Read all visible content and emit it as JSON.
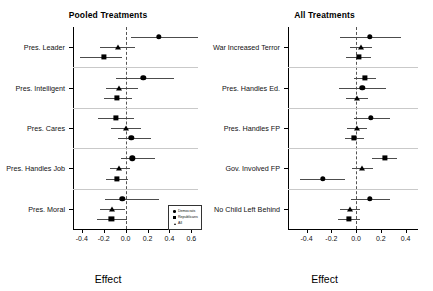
{
  "figure": {
    "width": 433,
    "height": 291,
    "background": "#ffffff",
    "marker_color": "#000000",
    "ci_color": "#4c4c4c",
    "separator_color": "#c9c9c9",
    "zero_line_color": "#555555"
  },
  "legend": {
    "entries": [
      {
        "label": "Democrats",
        "marker": "circle"
      },
      {
        "label": "Republicans",
        "marker": "square"
      },
      {
        "label": "All",
        "marker": "triangle"
      }
    ]
  },
  "chart_data": [
    {
      "type": "scatter",
      "panel": "left",
      "title": "Pooled Treatments",
      "xlabel": "Effect",
      "ylabel": "",
      "xlim": [
        -0.48,
        0.66
      ],
      "xticks": [
        -0.4,
        -0.2,
        0.0,
        0.2,
        0.4,
        0.6
      ],
      "xticklabels": [
        "-0.4",
        "-0.2",
        "0.0",
        "0.2",
        "0.4",
        "0.6"
      ],
      "grid": false,
      "zero_reference": 0.0,
      "categories": [
        "Pres. Leader",
        "Pres. Intelligent",
        "Pres. Cares",
        "Pres. Handles Job",
        "Pres. Moral"
      ],
      "series": [
        {
          "name": "Democrats",
          "marker": "circle",
          "values": [
            0.3,
            0.16,
            0.05,
            0.06,
            -0.03
          ],
          "ci_low": [
            0.05,
            -0.09,
            -0.07,
            -0.04,
            -0.19
          ],
          "ci_high": [
            0.66,
            0.44,
            0.23,
            0.27,
            0.3
          ]
        },
        {
          "name": "Republicans",
          "marker": "square",
          "values": [
            -0.2,
            -0.08,
            -0.09,
            -0.08,
            -0.13
          ],
          "ci_low": [
            -0.42,
            -0.2,
            -0.25,
            -0.18,
            -0.26
          ],
          "ci_high": [
            -0.03,
            0.06,
            0.08,
            0.02,
            0.01
          ]
        },
        {
          "name": "All",
          "marker": "triangle",
          "values": [
            -0.07,
            -0.06,
            0.0,
            -0.06,
            -0.12
          ],
          "ci_low": [
            -0.23,
            -0.18,
            -0.13,
            -0.14,
            -0.23
          ],
          "ci_high": [
            0.09,
            0.11,
            0.14,
            0.04,
            -0.01
          ]
        }
      ],
      "group_order": [
        [
          "Democrats",
          "All",
          "Republicans"
        ],
        [
          "Democrats",
          "All",
          "Republicans"
        ],
        [
          "Republicans",
          "All",
          "Democrats"
        ],
        [
          "Democrats",
          "All",
          "Republicans"
        ],
        [
          "Democrats",
          "All",
          "Republicans"
        ]
      ]
    },
    {
      "type": "scatter",
      "panel": "right",
      "title": "All Treatments",
      "xlabel": "Effect",
      "ylabel": "",
      "xlim": [
        -0.55,
        0.5
      ],
      "xticks": [
        -0.4,
        -0.2,
        0.0,
        0.2,
        0.4
      ],
      "xticklabels": [
        "-0.4",
        "-0.2",
        "0.0",
        "0.2",
        "0.4"
      ],
      "grid": false,
      "zero_reference": 0.0,
      "categories": [
        "War Increased Terror",
        "Pres. Handles Ed.",
        "Pres. Handles FP",
        "Gov. Involved FP",
        "No Child Left Behind"
      ],
      "series": [
        {
          "name": "Democrats",
          "marker": "circle",
          "values": [
            0.11,
            0.05,
            0.12,
            -0.27,
            0.11
          ],
          "ci_low": [
            -0.13,
            -0.14,
            -0.02,
            -0.45,
            -0.04
          ],
          "ci_high": [
            0.36,
            0.24,
            0.27,
            -0.09,
            0.27
          ]
        },
        {
          "name": "Republicans",
          "marker": "square",
          "values": [
            0.02,
            0.07,
            -0.02,
            0.23,
            -0.06
          ],
          "ci_low": [
            -0.08,
            -0.02,
            -0.09,
            0.13,
            -0.15
          ],
          "ci_high": [
            0.12,
            0.16,
            0.06,
            0.33,
            0.03
          ]
        },
        {
          "name": "All",
          "marker": "triangle",
          "values": [
            0.04,
            0.01,
            0.01,
            0.05,
            -0.05
          ],
          "ci_low": [
            -0.05,
            -0.08,
            -0.07,
            -0.03,
            -0.13
          ],
          "ci_high": [
            0.13,
            0.1,
            0.09,
            0.14,
            0.03
          ]
        }
      ],
      "group_order": [
        [
          "Democrats",
          "All",
          "Republicans"
        ],
        [
          "Republicans",
          "Democrats",
          "All"
        ],
        [
          "Democrats",
          "All",
          "Republicans"
        ],
        [
          "Republicans",
          "All",
          "Democrats"
        ],
        [
          "Democrats",
          "All",
          "Republicans"
        ]
      ]
    }
  ]
}
